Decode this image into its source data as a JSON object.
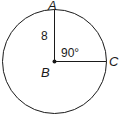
{
  "diagram": {
    "type": "circle-with-radii",
    "points": {
      "center": "B",
      "top": "A",
      "right": "C"
    },
    "segment_label": "8",
    "angle_label": "90°",
    "colors": {
      "stroke": "#1a1a1a",
      "background": "#ffffff"
    }
  }
}
